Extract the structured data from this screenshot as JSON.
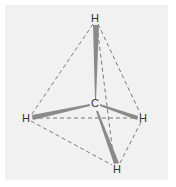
{
  "diagram": {
    "title": "",
    "molecule": "methane tetrahedral geometry",
    "colors": {
      "background": "#f1f1f1",
      "bond": "#8a8a8a",
      "edge": "#6a6a6a",
      "label": "#333333"
    },
    "atoms": [
      {
        "id": "C",
        "label": "C",
        "x": 95,
        "y": 107
      },
      {
        "id": "H1",
        "label": "H",
        "x": 95,
        "y": 22
      },
      {
        "id": "H2",
        "label": "H",
        "x": 26,
        "y": 122
      },
      {
        "id": "H3",
        "label": "H",
        "x": 144,
        "y": 122
      },
      {
        "id": "H4",
        "label": "H",
        "x": 117,
        "y": 173
      }
    ],
    "bonds": [
      {
        "from": "C",
        "to": "H1",
        "style": "wedge"
      },
      {
        "from": "C",
        "to": "H2",
        "style": "wedge"
      },
      {
        "from": "C",
        "to": "H3",
        "style": "wedge"
      },
      {
        "from": "C",
        "to": "H4",
        "style": "wedge"
      }
    ],
    "edges": [
      {
        "from": "H1",
        "to": "H2",
        "style": "dashed"
      },
      {
        "from": "H1",
        "to": "H3",
        "style": "dashed"
      },
      {
        "from": "H1",
        "to": "H4",
        "style": "dashed"
      },
      {
        "from": "H2",
        "to": "H3",
        "style": "dashed"
      },
      {
        "from": "H2",
        "to": "H4",
        "style": "dashed"
      },
      {
        "from": "H3",
        "to": "H4",
        "style": "dashed"
      }
    ]
  }
}
